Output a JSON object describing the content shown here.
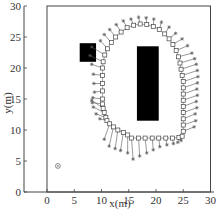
{
  "chart_data": {
    "type": "scatter",
    "title": "",
    "xlabel": "x(m)",
    "ylabel": "y(m)",
    "xlim": [
      -4,
      30
    ],
    "ylim": [
      0,
      30
    ],
    "xticks": [
      0,
      5,
      10,
      15,
      20,
      25,
      30
    ],
    "yticks": [
      0,
      5,
      10,
      15,
      20,
      25,
      30
    ],
    "grid": false,
    "legend": null,
    "workspace_boundary": {
      "x": [
        0,
        30
      ],
      "y": [
        0,
        30
      ]
    },
    "obstacles": [
      {
        "name": "small-obstacle",
        "x": [
          6,
          9
        ],
        "y": [
          21,
          24
        ],
        "color": "#000000"
      },
      {
        "name": "large-obstacle",
        "x": [
          16.5,
          20.5
        ],
        "y": [
          11.5,
          23.5
        ],
        "color": "#000000"
      }
    ],
    "start_marker": {
      "x": 2,
      "y": 4.2,
      "shape": "circle-dot"
    },
    "series": [
      {
        "name": "trajectory",
        "marker": "square",
        "points": [
          [
            10.3,
            13.5
          ],
          [
            10.5,
            12.8
          ],
          [
            10.8,
            12.0
          ],
          [
            11.0,
            11.5
          ],
          [
            11.5,
            11.0
          ],
          [
            12.2,
            10.5
          ],
          [
            13.0,
            10.0
          ],
          [
            14.0,
            9.6
          ],
          [
            14.8,
            9.2
          ],
          [
            15.5,
            8.7
          ],
          [
            16.8,
            8.7
          ],
          [
            18.0,
            8.7
          ],
          [
            19.3,
            8.7
          ],
          [
            20.5,
            8.7
          ],
          [
            21.8,
            8.7
          ],
          [
            23.0,
            8.7
          ],
          [
            24.2,
            8.8
          ],
          [
            24.8,
            9.0
          ],
          [
            25.0,
            9.8
          ],
          [
            25.0,
            10.8
          ],
          [
            25.0,
            11.8
          ],
          [
            25.0,
            12.8
          ],
          [
            25.0,
            13.8
          ],
          [
            25.0,
            14.8
          ],
          [
            25.0,
            15.8
          ],
          [
            25.0,
            16.8
          ],
          [
            25.0,
            17.8
          ],
          [
            24.8,
            18.8
          ],
          [
            24.6,
            19.8
          ],
          [
            24.4,
            20.8
          ],
          [
            24.1,
            21.8
          ],
          [
            23.7,
            22.8
          ],
          [
            23.1,
            23.8
          ],
          [
            22.4,
            24.7
          ],
          [
            21.6,
            25.5
          ],
          [
            20.6,
            26.2
          ],
          [
            19.5,
            26.7
          ],
          [
            18.3,
            27.0
          ],
          [
            17.1,
            27.1
          ],
          [
            15.9,
            26.9
          ],
          [
            14.7,
            26.5
          ],
          [
            13.6,
            25.8
          ],
          [
            12.6,
            25.0
          ],
          [
            11.8,
            24.1
          ],
          [
            11.1,
            23.1
          ],
          [
            10.6,
            22.1
          ],
          [
            10.3,
            21.0
          ],
          [
            10.2,
            20.0
          ],
          [
            10.2,
            18.8
          ],
          [
            10.2,
            17.5
          ],
          [
            10.2,
            16.3
          ],
          [
            10.2,
            15.0
          ],
          [
            10.2,
            14.2
          ]
        ]
      },
      {
        "name": "reference",
        "marker": "asterisk",
        "points": [
          [
            8.2,
            14.8
          ],
          [
            8.5,
            13.7
          ],
          [
            9.0,
            12.6
          ],
          [
            9.7,
            11.8
          ],
          [
            10.5,
            8.5
          ],
          [
            11.4,
            7.4
          ],
          [
            12.5,
            7.0
          ],
          [
            13.5,
            6.7
          ],
          [
            14.8,
            6.3
          ],
          [
            15.8,
            5.3
          ],
          [
            17.0,
            5.8
          ],
          [
            18.3,
            6.3
          ],
          [
            19.5,
            6.8
          ],
          [
            20.7,
            7.3
          ],
          [
            22.0,
            7.6
          ],
          [
            23.2,
            7.8
          ],
          [
            24.0,
            8.0
          ],
          [
            24.6,
            8.3
          ],
          [
            27.0,
            10.5
          ],
          [
            27.3,
            11.5
          ],
          [
            27.2,
            12.6
          ],
          [
            27.5,
            13.6
          ],
          [
            27.4,
            14.6
          ],
          [
            27.6,
            15.6
          ],
          [
            27.5,
            16.6
          ],
          [
            27.6,
            17.6
          ],
          [
            27.7,
            18.6
          ],
          [
            27.6,
            19.6
          ],
          [
            27.4,
            20.6
          ],
          [
            27.1,
            21.5
          ],
          [
            26.6,
            22.4
          ],
          [
            25.8,
            23.6
          ],
          [
            24.8,
            24.7
          ],
          [
            23.6,
            25.6
          ],
          [
            22.4,
            26.6
          ],
          [
            21.0,
            27.4
          ],
          [
            19.6,
            27.9
          ],
          [
            18.2,
            28.1
          ],
          [
            16.8,
            28.2
          ],
          [
            15.4,
            27.9
          ],
          [
            14.0,
            27.6
          ],
          [
            12.7,
            27.0
          ],
          [
            11.5,
            26.2
          ],
          [
            10.5,
            25.4
          ],
          [
            9.8,
            24.4
          ],
          [
            8.2,
            23.4
          ],
          [
            7.9,
            22.0
          ],
          [
            8.2,
            20.6
          ],
          [
            8.5,
            19.0
          ],
          [
            8.6,
            17.5
          ],
          [
            8.7,
            16.1
          ],
          [
            8.4,
            15.2
          ],
          [
            8.3,
            14.4
          ]
        ]
      }
    ]
  },
  "axes": {
    "xlabel": "x(m)",
    "ylabel": "y(m)",
    "xtick_labels": [
      "0",
      "5",
      "10",
      "15",
      "20",
      "25",
      "30"
    ],
    "ytick_labels": [
      "0",
      "5",
      "10",
      "15",
      "20",
      "25",
      "30"
    ]
  }
}
